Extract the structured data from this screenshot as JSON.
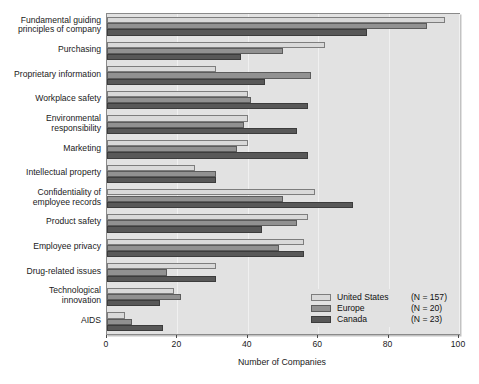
{
  "chart_data": {
    "type": "bar",
    "orientation": "horizontal",
    "title": "",
    "xlabel": "Number of Companies",
    "ylabel": "",
    "xlim": [
      0,
      100
    ],
    "xticks": [
      0,
      20,
      40,
      60,
      80,
      100
    ],
    "grid": true,
    "legend_position": "bottom-right",
    "categories": [
      "Fundamental guiding\nprinciples of company",
      "Purchasing",
      "Proprietary information",
      "Workplace safety",
      "Environmental\nresponsibility",
      "Marketing",
      "Intellectual property",
      "Confidentiality of\nemployee records",
      "Product safety",
      "Employee privacy",
      "Drug-related issues",
      "Technological\ninnovation",
      "AIDS"
    ],
    "series": [
      {
        "name": "United States",
        "n_label": "(N = 157)",
        "color": "#d9d9d9",
        "values": [
          96,
          62,
          31,
          40,
          40,
          40,
          25,
          59,
          57,
          56,
          31,
          19,
          5
        ]
      },
      {
        "name": "Europe",
        "n_label": "(N = 20)",
        "color": "#919191",
        "values": [
          91,
          50,
          58,
          41,
          39,
          37,
          31,
          50,
          54,
          49,
          17,
          21,
          7
        ]
      },
      {
        "name": "Canada",
        "n_label": "(N = 23)",
        "color": "#585858",
        "values": [
          74,
          38,
          45,
          57,
          54,
          57,
          31,
          70,
          44,
          56,
          31,
          15,
          16
        ]
      }
    ]
  },
  "axis": {
    "x_title": "Number of Companies",
    "tick_labels": [
      "0",
      "20",
      "40",
      "60",
      "80",
      "100"
    ]
  },
  "legend": {
    "items": [
      {
        "label": "United States",
        "n": "(N = 157)",
        "swatch": "us"
      },
      {
        "label": "Europe",
        "n": "(N = 20)",
        "swatch": "europe"
      },
      {
        "label": "Canada",
        "n": "(N = 23)",
        "swatch": "canada"
      }
    ]
  }
}
